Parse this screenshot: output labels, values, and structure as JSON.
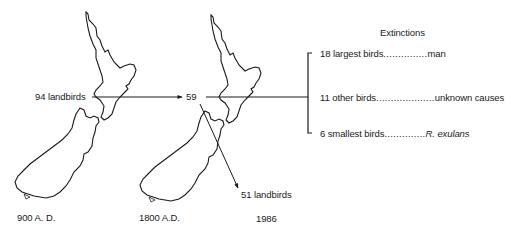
{
  "diagram": {
    "title": "Extinctions",
    "start_label": "94 landbirds",
    "mid_value": "59",
    "end_label": "51 landbirds",
    "dates": [
      "900 A. D.",
      "1800 A.D.",
      "1986"
    ],
    "extinctions": [
      {
        "count_label": "18 largest birds",
        "leader": "...............",
        "cause": "man",
        "italic": false
      },
      {
        "count_label": "11 other birds",
        "leader": "....................",
        "cause": "unknown causes",
        "italic": false
      },
      {
        "count_label": "6 smallest birds",
        "leader": "..............",
        "cause": "R. exulans",
        "italic": true
      }
    ],
    "maps": [
      "new-zealand-900ad",
      "new-zealand-1800ad"
    ],
    "colors": {
      "line": "#1a1a1a",
      "background": "#ffffff"
    }
  }
}
